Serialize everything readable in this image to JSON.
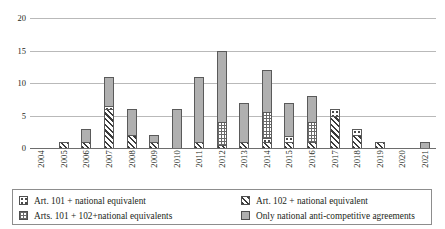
{
  "chart_data": {
    "type": "bar",
    "stacked": true,
    "title": "",
    "xlabel": "",
    "ylabel": "",
    "ylim": [
      0,
      20
    ],
    "yticks": [
      0,
      5,
      10,
      15,
      20
    ],
    "grid": true,
    "legend_position": "bottom",
    "categories": [
      "2004",
      "2005",
      "2006",
      "2007",
      "2008",
      "2009",
      "2010",
      "2011",
      "2012",
      "2013",
      "2014",
      "2015",
      "2016",
      "2017",
      "2018",
      "2019",
      "2020",
      "2021"
    ],
    "series": [
      {
        "name": "Art. 101 + national equivalent",
        "pattern": "dotted-small-square",
        "values": [
          0,
          0,
          0,
          0.4,
          0,
          0,
          0,
          0,
          0,
          0,
          0.5,
          0.8,
          0,
          1,
          1,
          0,
          0,
          0
        ]
      },
      {
        "name": "Art. 102 + national equivalent",
        "pattern": "diagonal-hatch",
        "values": [
          0,
          1,
          1,
          6,
          2,
          1,
          0,
          1,
          0.5,
          1,
          1,
          1,
          1,
          5,
          2,
          1,
          0,
          0
        ]
      },
      {
        "name": "Arts. 101 + 102+national equivalents",
        "pattern": "checkered",
        "values": [
          0,
          0,
          0,
          0,
          0,
          0,
          0,
          0,
          3.5,
          0,
          4,
          0,
          3,
          0,
          0,
          0,
          0,
          0
        ]
      },
      {
        "name": "Only national anti-competitive agreements",
        "pattern": "solid-gray",
        "values": [
          0,
          0,
          2,
          4.6,
          4,
          1,
          6,
          10,
          11,
          6,
          6.5,
          5.2,
          4,
          0,
          0,
          0,
          0,
          1
        ]
      }
    ],
    "totals": [
      0,
      1,
      3,
      11,
      6,
      2,
      6,
      11,
      15,
      7,
      12,
      7,
      8,
      6,
      3,
      1,
      0,
      1
    ]
  },
  "axis": {
    "y_tick_labels": [
      "0",
      "5",
      "10",
      "15",
      "20"
    ],
    "x_tick_labels": [
      "2004",
      "2005",
      "2006",
      "2007",
      "2008",
      "2009",
      "2010",
      "2011",
      "2012",
      "2013",
      "2014",
      "2015",
      "2016",
      "2017",
      "2018",
      "2019",
      "2020",
      "2021"
    ]
  },
  "legend": {
    "items": [
      {
        "label": "Art. 101 + national equivalent",
        "swatch": "dotted-small-square-swatch"
      },
      {
        "label": "Art. 102 + national equivalent",
        "swatch": "diagonal-hatch-swatch"
      },
      {
        "label": "Arts. 101 + 102+national equivalents",
        "swatch": "checkered-swatch"
      },
      {
        "label": "Only national anti-competitive agreements",
        "swatch": "solid-gray-swatch"
      }
    ]
  },
  "colors": {
    "gray_fill": "#b0b0b0",
    "hatch_dark": "#3b3b3b",
    "gridline": "#b9b9b9",
    "axis": "#6d6d6d",
    "text": "#231f20",
    "legend_border": "#8d8d8d"
  }
}
